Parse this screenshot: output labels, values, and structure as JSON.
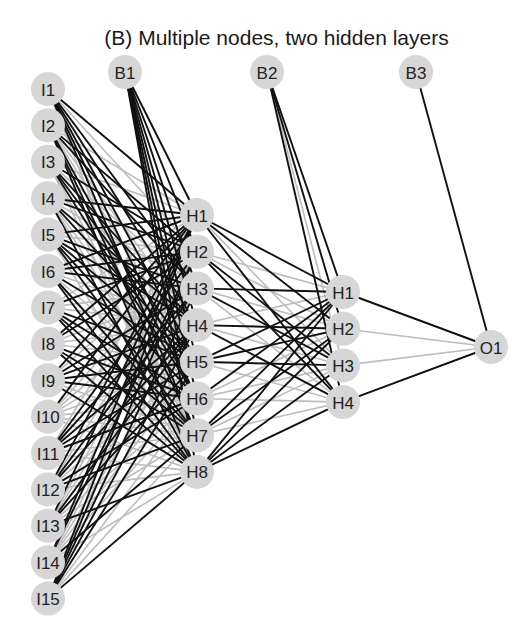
{
  "title": "(B) Multiple nodes, two hidden layers",
  "colors": {
    "node_fill": "#d6d6d6",
    "positive_edge": "#111111",
    "negative_edge": "#bdbdbd",
    "background": "#ffffff"
  },
  "layers": {
    "input": {
      "x": 48,
      "y0": 89,
      "dy": 36.4,
      "labels": [
        "I1",
        "I2",
        "I3",
        "I4",
        "I5",
        "I6",
        "I7",
        "I8",
        "I9",
        "I10",
        "I11",
        "I12",
        "I13",
        "I14",
        "I15"
      ]
    },
    "hidden1": {
      "x": 197,
      "y0": 215,
      "dy": 36.7,
      "labels": [
        "H1",
        "H2",
        "H3",
        "H4",
        "H5",
        "H6",
        "H7",
        "H8"
      ]
    },
    "hidden2": {
      "x": 343,
      "y0": 292,
      "dy": 36.7,
      "labels": [
        "H1",
        "H2",
        "H3",
        "H4"
      ]
    },
    "output": {
      "x": 491,
      "y0": 347,
      "dy": 0,
      "labels": [
        "O1"
      ]
    }
  },
  "bias": [
    {
      "label": "B1",
      "x": 125,
      "y": 72,
      "target": "hidden1"
    },
    {
      "label": "B2",
      "x": 267,
      "y": 72,
      "target": "hidden2"
    },
    {
      "label": "B3",
      "x": 416,
      "y": 72,
      "target": "output"
    }
  ],
  "h2_to_output_dark": [
    true,
    false,
    false,
    true
  ],
  "h1_to_h2_dark": [
    [
      true,
      true,
      false,
      true
    ],
    [
      false,
      false,
      true,
      true
    ],
    [
      true,
      false,
      true,
      false
    ],
    [
      false,
      true,
      false,
      true
    ],
    [
      true,
      true,
      true,
      false
    ],
    [
      true,
      false,
      false,
      false
    ],
    [
      true,
      true,
      false,
      false
    ],
    [
      true,
      true,
      true,
      true
    ]
  ],
  "b1_dark_fraction": 0.75,
  "b2_dark": [
    true,
    true,
    false,
    true
  ]
}
